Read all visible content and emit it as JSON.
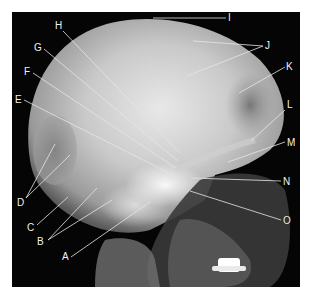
{
  "figure": {
    "colors": {
      "background": "#ffffff",
      "film": "#050505",
      "leader_lines": "#e6e6e6",
      "label_text": "#f2f2f2"
    },
    "labels": [
      {
        "id": "A",
        "text": "A",
        "x": 62,
        "y": 252,
        "line": [
          71,
          257,
          150,
          202
        ]
      },
      {
        "id": "B",
        "text": "B",
        "x": 37,
        "y": 237,
        "line": [
          48,
          240,
          97,
          188
        ],
        "line2": [
          48,
          240,
          112,
          200
        ]
      },
      {
        "id": "C",
        "text": "C",
        "x": 27,
        "y": 223,
        "line": [
          37,
          225,
          68,
          197
        ]
      },
      {
        "id": "D",
        "text": "D",
        "x": 17,
        "y": 198,
        "line": [
          26,
          198,
          55,
          144
        ],
        "line2": [
          26,
          198,
          70,
          155
        ]
      },
      {
        "id": "E",
        "text": "E",
        "x": 15,
        "y": 95,
        "line": [
          24,
          100,
          173,
          175
        ]
      },
      {
        "id": "F",
        "text": "F",
        "x": 24,
        "y": 67,
        "line": [
          33,
          73,
          176,
          168
        ]
      },
      {
        "id": "G",
        "text": "G",
        "x": 34,
        "y": 43,
        "line": [
          44,
          49,
          178,
          161
        ]
      },
      {
        "id": "H",
        "text": "H",
        "x": 55,
        "y": 21,
        "line": [
          63,
          31,
          180,
          153
        ]
      },
      {
        "id": "I",
        "text": "I",
        "x": 228,
        "y": 13,
        "line": [
          153,
          18,
          226,
          18
        ]
      },
      {
        "id": "J",
        "text": "J",
        "x": 265,
        "y": 41,
        "line": [
          263,
          46,
          193,
          41
        ],
        "line2": [
          263,
          46,
          187,
          76
        ]
      },
      {
        "id": "K",
        "text": "K",
        "x": 286,
        "y": 62,
        "line": [
          285,
          67,
          239,
          93
        ]
      },
      {
        "id": "L",
        "text": "L",
        "x": 287,
        "y": 100,
        "line": [
          285,
          110,
          251,
          141
        ]
      },
      {
        "id": "M",
        "text": "M",
        "x": 287,
        "y": 138,
        "line": [
          285,
          142,
          228,
          162
        ]
      },
      {
        "id": "N",
        "text": "N",
        "x": 283,
        "y": 177,
        "line": [
          281,
          181,
          191,
          178
        ]
      },
      {
        "id": "O",
        "text": "O",
        "x": 283,
        "y": 216,
        "line": [
          281,
          220,
          190,
          191
        ]
      }
    ]
  }
}
